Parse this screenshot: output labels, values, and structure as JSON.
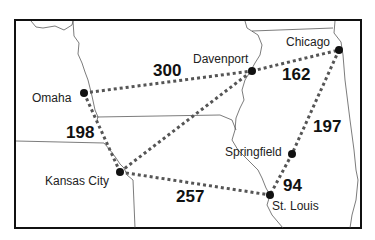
{
  "map": {
    "cities": [
      {
        "name": "Omaha",
        "x": 84,
        "y": 93
      },
      {
        "name": "Davenport",
        "x": 252,
        "y": 71
      },
      {
        "name": "Chicago",
        "x": 339,
        "y": 50
      },
      {
        "name": "Kansas City",
        "x": 120,
        "y": 172
      },
      {
        "name": "Springfield",
        "x": 292,
        "y": 154
      },
      {
        "name": "St. Louis",
        "x": 270,
        "y": 195
      }
    ],
    "routes": [
      {
        "from": "Omaha",
        "to": "Davenport",
        "distance": "300"
      },
      {
        "from": "Davenport",
        "to": "Chicago",
        "distance": "162"
      },
      {
        "from": "Omaha",
        "to": "Kansas City",
        "distance": "198"
      },
      {
        "from": "Kansas City",
        "to": "Davenport",
        "distance": ""
      },
      {
        "from": "Kansas City",
        "to": "St. Louis",
        "distance": "257"
      },
      {
        "from": "Chicago",
        "to": "Springfield",
        "distance": "197"
      },
      {
        "from": "Springfield",
        "to": "St. Louis",
        "distance": "94"
      }
    ]
  }
}
